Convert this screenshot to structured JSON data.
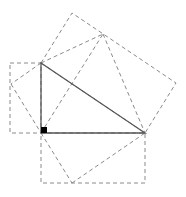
{
  "diagram": {
    "title": "",
    "type": "pythagorean-proof-figure",
    "colors": {
      "triangle_stroke": "#555555",
      "dashed_stroke": "#8a8a8a",
      "right_angle_marker": "#000000",
      "background": "#ffffff"
    },
    "points": {
      "A": [
        41,
        63
      ],
      "B": [
        145,
        133
      ],
      "C": [
        41,
        133
      ],
      "P1": [
        72,
        13
      ],
      "P2": [
        103,
        34
      ],
      "R": [
        176,
        83
      ],
      "L": [
        11,
        84
      ],
      "M": [
        72,
        183
      ]
    },
    "triangle": [
      [
        41,
        63
      ],
      [
        145,
        133
      ],
      [
        41,
        133
      ]
    ],
    "right_angle_marker": {
      "x": 41,
      "y": 127,
      "size": 6
    },
    "dashed_polygons": [
      {
        "name": "left-rectangle",
        "points": [
          [
            10,
            63
          ],
          [
            41,
            63
          ],
          [
            41,
            133
          ],
          [
            10,
            133
          ]
        ]
      },
      {
        "name": "bottom-rectangle",
        "points": [
          [
            41,
            133
          ],
          [
            145,
            133
          ],
          [
            145,
            183
          ],
          [
            41,
            183
          ]
        ]
      },
      {
        "name": "upper-parallelogram",
        "points": [
          [
            41,
            63
          ],
          [
            72,
            13
          ],
          [
            176,
            83
          ],
          [
            145,
            133
          ]
        ]
      }
    ],
    "dashed_lines": [
      {
        "name": "a-to-l",
        "from": [
          41,
          63
        ],
        "to": [
          11,
          84
        ]
      },
      {
        "name": "l-to-c",
        "from": [
          11,
          84
        ],
        "to": [
          41,
          133
        ]
      },
      {
        "name": "a-to-p2",
        "from": [
          41,
          63
        ],
        "to": [
          103,
          34
        ]
      },
      {
        "name": "p2-to-b",
        "from": [
          103,
          34
        ],
        "to": [
          145,
          133
        ]
      },
      {
        "name": "c-to-p2",
        "from": [
          41,
          133
        ],
        "to": [
          103,
          34
        ]
      },
      {
        "name": "c-to-m",
        "from": [
          41,
          133
        ],
        "to": [
          72,
          183
        ]
      },
      {
        "name": "m-to-b",
        "from": [
          72,
          183
        ],
        "to": [
          145,
          133
        ]
      }
    ]
  }
}
